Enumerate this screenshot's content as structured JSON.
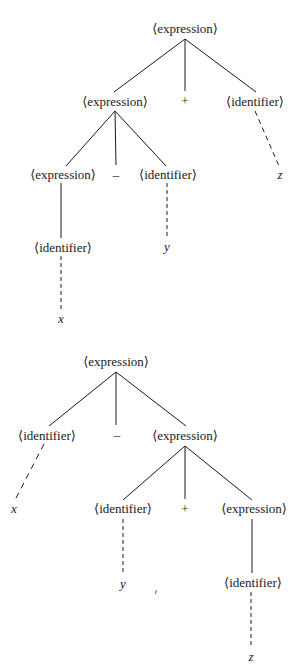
{
  "nonterminals": {
    "expression": "⟨expression⟩",
    "identifier": "⟨identifier⟩"
  },
  "trees": [
    {
      "id": "tree-1",
      "description": "(x - y) + z",
      "nodes": {
        "root": "⟨expression⟩",
        "left_expr": "⟨expression⟩",
        "plus": "+",
        "right_ident": "⟨identifier⟩",
        "ll_expr": "⟨expression⟩",
        "minus": "–",
        "lr_ident": "⟨identifier⟩",
        "z": "z",
        "lll_ident": "⟨identifier⟩",
        "y": "y",
        "x": "x"
      }
    },
    {
      "id": "tree-2",
      "description": "x - (y + z)",
      "nodes": {
        "root": "⟨expression⟩",
        "left_ident": "⟨identifier⟩",
        "minus": "–",
        "right_expr": "⟨expression⟩",
        "x": "x",
        "rl_ident": "⟨identifier⟩",
        "plus": "+",
        "rr_expr": "⟨expression⟩",
        "y": "y",
        "rrr_ident": "⟨identifier⟩",
        "z": "z"
      }
    }
  ],
  "stray_mark": "ι"
}
